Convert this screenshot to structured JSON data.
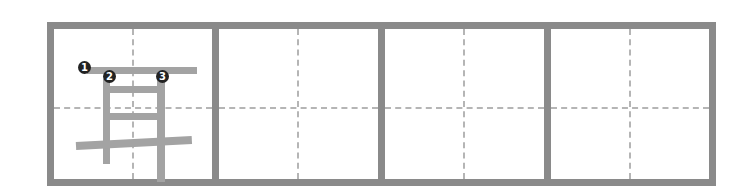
{
  "worksheet": {
    "character": "耳",
    "cell_count": 4,
    "stroke_order_labels": [
      "1",
      "2",
      "3"
    ],
    "colors": {
      "border": "#8a8a8a",
      "guide": "#b5b5b5",
      "stroke": "#a3a3a3",
      "label_bg": "#222222"
    }
  }
}
